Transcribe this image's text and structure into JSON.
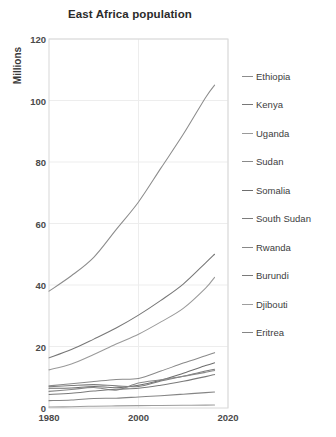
{
  "chart_data": {
    "type": "line",
    "title": "East Africa population",
    "xlabel": "",
    "ylabel": "Millions",
    "xlim": [
      1980,
      2020
    ],
    "ylim": [
      0,
      120
    ],
    "yticks": [
      0,
      20,
      40,
      60,
      80,
      100,
      120
    ],
    "xticks": [
      1980,
      2000,
      2020
    ],
    "grid": true,
    "legend_position": "right",
    "x": [
      1980,
      1985,
      1990,
      1995,
      2000,
      2005,
      2010,
      2015,
      2017
    ],
    "series": [
      {
        "name": "Ethiopia",
        "color": "#8c8c8c",
        "values": [
          38.0,
          43.0,
          49.0,
          58.0,
          67.0,
          78.0,
          89.0,
          101.0,
          105.0
        ]
      },
      {
        "name": "Kenya",
        "color": "#777777",
        "values": [
          16.3,
          19.0,
          22.4,
          26.0,
          30.2,
          35.0,
          40.3,
          47.2,
          50.0
        ]
      },
      {
        "name": "Uganda",
        "color": "#9a9a9a",
        "values": [
          12.4,
          14.3,
          17.4,
          20.8,
          24.0,
          28.0,
          32.4,
          39.0,
          42.5
        ]
      },
      {
        "name": "Sudan",
        "color": "#8a8a8a",
        "values": [
          7.2,
          7.9,
          8.6,
          9.3,
          9.6,
          12.0,
          14.6,
          17.0,
          18.0
        ]
      },
      {
        "name": "Somalia",
        "color": "#6e6e6e",
        "values": [
          6.4,
          6.5,
          7.0,
          6.6,
          7.4,
          9.0,
          11.3,
          13.8,
          14.7
        ]
      },
      {
        "name": "South Sudan",
        "color": "#7c7c7c",
        "values": [
          6.9,
          7.3,
          7.6,
          7.2,
          7.0,
          8.8,
          10.3,
          12.0,
          12.6
        ]
      },
      {
        "name": "Rwanda",
        "color": "#888888",
        "values": [
          5.4,
          6.0,
          6.7,
          5.8,
          8.1,
          9.2,
          10.3,
          11.6,
          12.2
        ]
      },
      {
        "name": "Burundi",
        "color": "#7a7a7a",
        "values": [
          4.4,
          4.8,
          5.5,
          6.1,
          6.4,
          7.4,
          8.7,
          10.2,
          10.9
        ]
      },
      {
        "name": "Djibouti",
        "color": "#9e9e9e",
        "values": [
          0.34,
          0.4,
          0.59,
          0.69,
          0.77,
          0.83,
          0.89,
          0.94,
          0.97
        ]
      },
      {
        "name": "Eritrea",
        "color": "#858585",
        "values": [
          2.4,
          2.6,
          3.1,
          3.2,
          3.6,
          4.0,
          4.5,
          5.0,
          5.2
        ]
      }
    ]
  },
  "axis": {
    "ylabel": "Millions",
    "yticks": [
      "0",
      "20",
      "40",
      "60",
      "80",
      "100",
      "120"
    ],
    "xticks": [
      "1980",
      "2000",
      "2020"
    ]
  },
  "legend": {
    "items": [
      {
        "label": "Ethiopia"
      },
      {
        "label": "Kenya"
      },
      {
        "label": "Uganda"
      },
      {
        "label": "Sudan"
      },
      {
        "label": "Somalia"
      },
      {
        "label": "South Sudan"
      },
      {
        "label": "Rwanda"
      },
      {
        "label": "Burundi"
      },
      {
        "label": "Djibouti"
      },
      {
        "label": "Eritrea"
      }
    ]
  },
  "colors": {
    "plot_border": "#d8d8d8",
    "grid": "#ededed",
    "background": "#ffffff",
    "text": "#3a3a3a"
  }
}
